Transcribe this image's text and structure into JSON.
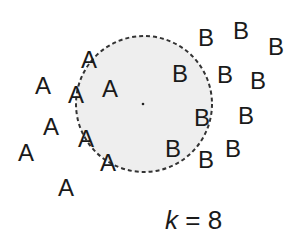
{
  "diagram": {
    "type": "k-nearest-neighbors illustration",
    "circle": {
      "cx": 144,
      "cy": 104,
      "r": 68,
      "fill": "#eeeeee",
      "stroke": "#333333",
      "style": "dashed"
    },
    "query_point": {
      "x": 143,
      "y": 104
    },
    "points": [
      {
        "label": "A",
        "x": 89,
        "y": 60
      },
      {
        "label": "A",
        "x": 43,
        "y": 86
      },
      {
        "label": "A",
        "x": 76,
        "y": 95
      },
      {
        "label": "A",
        "x": 110,
        "y": 89
      },
      {
        "label": "A",
        "x": 51,
        "y": 127
      },
      {
        "label": "A",
        "x": 86,
        "y": 139
      },
      {
        "label": "A",
        "x": 26,
        "y": 153
      },
      {
        "label": "A",
        "x": 108,
        "y": 163
      },
      {
        "label": "A",
        "x": 66,
        "y": 188
      },
      {
        "label": "B",
        "x": 206,
        "y": 38
      },
      {
        "label": "B",
        "x": 241,
        "y": 31
      },
      {
        "label": "B",
        "x": 276,
        "y": 47
      },
      {
        "label": "B",
        "x": 180,
        "y": 74
      },
      {
        "label": "B",
        "x": 225,
        "y": 75
      },
      {
        "label": "B",
        "x": 258,
        "y": 81
      },
      {
        "label": "B",
        "x": 202,
        "y": 118
      },
      {
        "label": "B",
        "x": 246,
        "y": 116
      },
      {
        "label": "B",
        "x": 173,
        "y": 149
      },
      {
        "label": "B",
        "x": 206,
        "y": 160
      },
      {
        "label": "B",
        "x": 233,
        "y": 149
      }
    ],
    "caption": {
      "var": "k",
      "eq": " = 8"
    }
  }
}
